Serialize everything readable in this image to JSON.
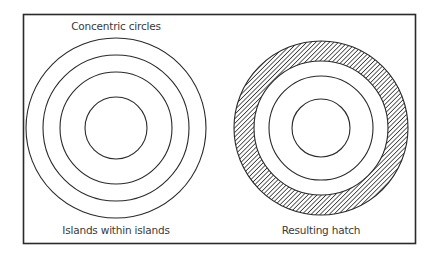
{
  "figure": {
    "left_panel": {
      "title": "Concentric circles",
      "caption": "Islands within islands",
      "ring_count": 4
    },
    "right_panel": {
      "caption": "Resulting hatch",
      "ring_count": 4,
      "hatched_band": "outermost ring (between circle 1 and circle 2)",
      "hatch_pattern": "diagonal lines"
    },
    "colors": {
      "line": "#2a2a2a",
      "text": "#3a3a3a",
      "background": "#ffffff"
    }
  }
}
